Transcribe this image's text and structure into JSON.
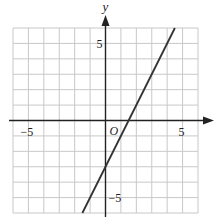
{
  "chart_data": {
    "type": "line",
    "title": "",
    "xlabel": "x",
    "ylabel": "y",
    "origin_label": "O",
    "xlim": [
      -6,
      6
    ],
    "ylim": [
      -6,
      6
    ],
    "grid": true,
    "x_tick_labels": [
      {
        "value": -5,
        "label": "−5"
      },
      {
        "value": 5,
        "label": "5"
      }
    ],
    "y_tick_labels": [
      {
        "value": 5,
        "label": "5"
      },
      {
        "value": -5,
        "label": "−5"
      }
    ],
    "series": [
      {
        "name": "y = 2x − 3",
        "slope": 2,
        "intercept": -3,
        "x": [
          -1.5,
          4.5
        ],
        "y": [
          -6,
          6
        ]
      }
    ]
  },
  "colors": {
    "grid": "#c8c8c8",
    "axis": "#222222",
    "line": "#333333"
  }
}
